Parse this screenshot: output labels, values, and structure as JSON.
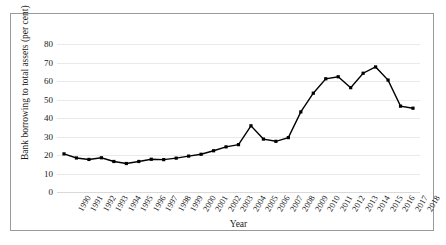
{
  "chart_data": {
    "type": "line",
    "title": "",
    "xlabel": "Year",
    "ylabel": "Bank borrowing to total assets (per cent)",
    "ylim": [
      0,
      80
    ],
    "yticks": [
      0,
      10,
      20,
      30,
      40,
      50,
      60,
      70,
      80
    ],
    "grid": true,
    "legend": "none",
    "marker": "square",
    "line_color": "#000000",
    "categories": [
      "1990",
      "1991",
      "1992",
      "1993",
      "1994",
      "1995",
      "1996",
      "1997",
      "1998",
      "1999",
      "2000",
      "2001",
      "2002",
      "2003",
      "2004",
      "2005",
      "2006",
      "2007",
      "2008",
      "2009",
      "2010",
      "2011",
      "2012",
      "2013",
      "2014",
      "2015",
      "2016",
      "2017",
      "2018"
    ],
    "values": [
      20.6,
      18.4,
      17.6,
      18.5,
      16.5,
      15.4,
      16.5,
      17.7,
      17.5,
      18.3,
      19.4,
      20.4,
      22.3,
      24.4,
      25.6,
      35.8,
      28.6,
      27.4,
      29.4,
      43.3,
      53.4,
      61.2,
      62.3,
      56.4,
      64.2,
      67.6,
      60.5,
      46.4,
      45.3
    ],
    "series": [
      {
        "name": "Bank borrowing to total assets",
        "values": [
          20.6,
          18.4,
          17.6,
          18.5,
          16.5,
          15.4,
          16.5,
          17.7,
          17.5,
          18.3,
          19.4,
          20.4,
          22.3,
          24.4,
          25.6,
          35.8,
          28.6,
          27.4,
          29.4,
          43.3,
          53.4,
          61.2,
          62.3,
          56.4,
          64.2,
          67.6,
          60.5,
          46.4,
          45.3
        ]
      }
    ]
  }
}
